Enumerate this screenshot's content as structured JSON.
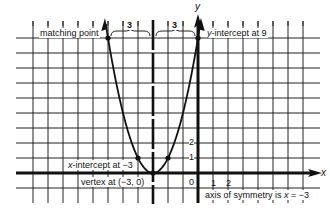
{
  "chart_data": {
    "type": "line",
    "title": "",
    "function": "y = (x + 3)^2",
    "xlabel": "x",
    "ylabel": "y",
    "xlim": [
      -11,
      7
    ],
    "ylim": [
      -1,
      9
    ],
    "grid": true,
    "series": [
      {
        "name": "parabola",
        "x": [
          -6,
          -5,
          -4,
          -3,
          -2,
          -1,
          0
        ],
        "y": [
          9,
          4,
          1,
          0,
          1,
          4,
          9
        ]
      }
    ],
    "marked_points": [
      {
        "name": "matching point",
        "x": -6,
        "y": 9
      },
      {
        "name": "y-intercept",
        "x": 0,
        "y": 9
      },
      {
        "name": "point",
        "x": -4,
        "y": 1
      },
      {
        "name": "point",
        "x": -2,
        "y": 1
      },
      {
        "name": "vertex",
        "x": -3,
        "y": 0
      }
    ],
    "axis_of_symmetry": -3,
    "brackets": [
      {
        "from": -6,
        "to": -3,
        "label": "3"
      },
      {
        "from": -3,
        "to": 0,
        "label": "3"
      }
    ],
    "tick_labels": {
      "x": [
        "0",
        "1",
        "2"
      ],
      "y": [
        "1",
        "2"
      ]
    },
    "annotations": {
      "matching_point": "matching point",
      "y_intercept": "y-intercept at 9",
      "x_intercept": "x-intercept at −3",
      "vertex": "vertex at (−3, 0)",
      "axis_of_symmetry": "axis of symmetry is x = −3"
    }
  },
  "labels": {
    "matching_point": "matching point",
    "y_intercept_var": "y",
    "y_intercept_rest": "-intercept at 9",
    "x_intercept_var": "x",
    "x_intercept_rest": "-intercept at −3",
    "vertex": "vertex at (−3, 0)",
    "axis_sym_pre": "axis of symmetry is ",
    "axis_sym_var": "x",
    "axis_sym_post": " = −3",
    "bracket_left": "3",
    "bracket_right": "3",
    "origin": "0",
    "x_tick_1": "1",
    "x_tick_2": "2",
    "y_tick_1": "1",
    "y_tick_2": "2",
    "x_axis_name": "x",
    "y_axis_name": "y"
  }
}
